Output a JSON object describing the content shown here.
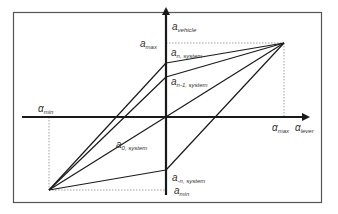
{
  "diagram": {
    "type": "hysteresis-mapping",
    "axes": {
      "x_label": {
        "main": "α",
        "sub": "lever"
      },
      "y_label": {
        "main": "a",
        "sub": "vehicle"
      }
    },
    "labels": {
      "a_max": {
        "main": "a",
        "sub": "max"
      },
      "a_min": {
        "main": "a",
        "sub": "min"
      },
      "alpha_max": {
        "main": "α",
        "sub": "max"
      },
      "alpha_min": {
        "main": "α",
        "sub": "min"
      },
      "a_n_system": {
        "main": "a",
        "sub": "n, system"
      },
      "a_n1_system": {
        "main": "a",
        "sub": "n-1, system"
      },
      "a_0_system": {
        "main": "a",
        "sub": "0, system"
      },
      "a_neg_n_system": {
        "main": "a",
        "sub": "-n, system"
      }
    },
    "colors": {
      "line": "#1a1a1a",
      "frame": "#555555",
      "dotted": "#888888",
      "text": "#333333"
    }
  }
}
